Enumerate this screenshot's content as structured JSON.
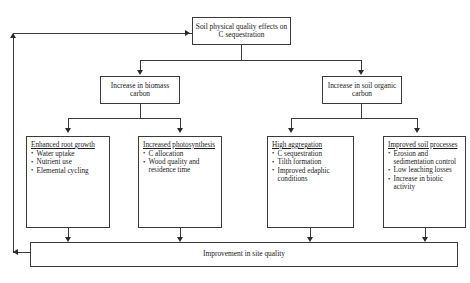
{
  "diagram": {
    "type": "flowchart",
    "root": {
      "label": "Soil physical quality effects on C sequestration"
    },
    "level2": [
      {
        "label": "Increase in biomass carbon"
      },
      {
        "label": "Increase in soil organic carbon"
      }
    ],
    "leaves": [
      {
        "heading": "Enhanced root growth",
        "bullets": [
          "Water uptake",
          "Nutrient use",
          "Elemental cycling"
        ]
      },
      {
        "heading": "Increased photosynthesis",
        "bullets": [
          "C allocation",
          "Wood quality and residence time"
        ]
      },
      {
        "heading": "High aggregation",
        "bullets": [
          "C sequestration",
          "Tilth formation",
          "Improved edaphic conditions"
        ]
      },
      {
        "heading": "Improved soil processes",
        "bullets": [
          "Erosion and sedimentation control",
          "Low leaching losses",
          "Increase in biotic activity"
        ]
      }
    ],
    "outcome": {
      "label": "Improvement in site quality"
    },
    "colors": {
      "line": "#3a3a3a",
      "arrow": "#2b2b2b",
      "text": "#1a1a1a",
      "background": "#ffffff"
    }
  }
}
